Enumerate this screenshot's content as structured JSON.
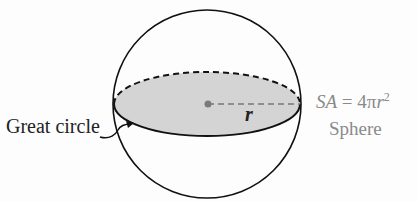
{
  "diagram": {
    "title": "Sphere",
    "great_circle_label": "Great circle",
    "radius_label": "r",
    "formula": {
      "lhs": "SA",
      "equals": "=",
      "coefficient": "4π",
      "variable": "r",
      "exponent": "2"
    },
    "shape_name": "Sphere",
    "colors": {
      "outline": "#111111",
      "fill": "#d4d4d4",
      "center_dot": "#7a7a7a",
      "formula_text": "#8a8a8a"
    }
  }
}
